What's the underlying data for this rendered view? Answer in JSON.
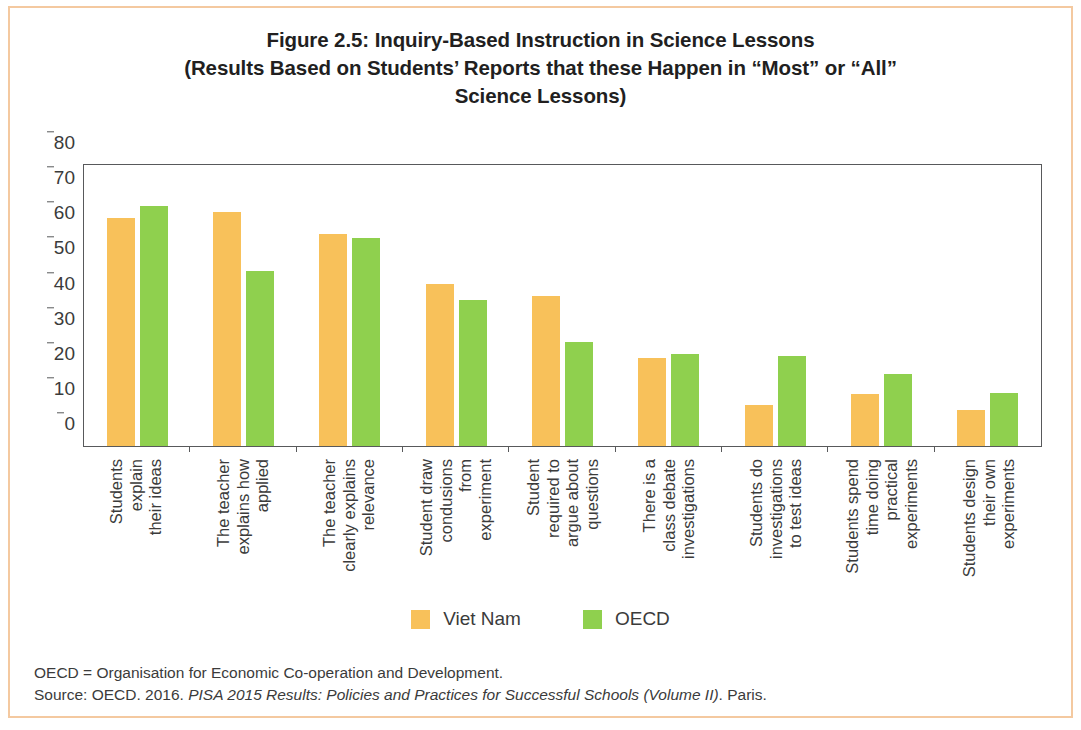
{
  "title": {
    "line1": "Figure 2.5: Inquiry-Based Instruction in Science Lessons",
    "line2": "(Results Based on Students’ Reports that these Happen in “Most” or “All”",
    "line3": "Science Lessons)"
  },
  "legend": {
    "vietnam_label": "Viet Nam",
    "oecd_label": "OECD"
  },
  "notes": {
    "abbreviation": "OECD = Organisation for Economic Co-operation and Development.",
    "source_prefix": "Source: OECD. 2016. ",
    "source_italic": "PISA 2015 Results: Policies and Practices for Successful Schools (Volume II)",
    "source_suffix": ". Paris."
  },
  "chart_data": {
    "type": "bar",
    "title": "Figure 2.5: Inquiry-Based Instruction in Science Lessons (Results Based on Students’ Reports that these Happen in “Most” or “All” Science Lessons)",
    "xlabel": "",
    "ylabel": "",
    "ylim": [
      0,
      80
    ],
    "yticks": [
      0,
      10,
      20,
      30,
      40,
      50,
      60,
      70,
      80
    ],
    "ytick_labels": [
      "0",
      "10",
      "20",
      "30",
      "40",
      "50",
      "60",
      "70",
      "80"
    ],
    "grid": false,
    "legend_position": "bottom-center",
    "colors": {
      "vietnam": "#f8c15a",
      "oecd": "#8fd04e",
      "axis": "#58595b",
      "text": "#3b3b3b",
      "frame": "#f4c9a0"
    },
    "categories": [
      "Students explain their ideas",
      "The teacher explains how applied",
      "The teacher clearly explains relevance",
      "Student draw condusions from experiment",
      "Student required to argue about questions",
      "There is a class debate investigations",
      "Students do investigations to test ideas",
      "Students spend time doing practical experiments",
      "Students design their own experiments"
    ],
    "category_lines": [
      [
        "Students",
        "explain",
        "their ideas"
      ],
      [
        "The teacher",
        "explains how",
        "applied"
      ],
      [
        "The teacher",
        "clearly explains",
        "relevance"
      ],
      [
        "Student draw",
        "condusions",
        "from",
        "experiment"
      ],
      [
        "Student",
        "required to",
        "argue about",
        "questions"
      ],
      [
        "There is a",
        "class debate",
        "investigations"
      ],
      [
        "Students do",
        "investigations",
        "to test ideas"
      ],
      [
        "Students spend",
        "time doing",
        "practical",
        "experiments"
      ],
      [
        "Students design",
        "their own",
        "experiments"
      ]
    ],
    "series": [
      {
        "name": "Viet Nam",
        "color": "#f8c15a",
        "values": [
          65.0,
          66.7,
          60.5,
          46.0,
          42.7,
          25.1,
          11.7,
          14.9,
          10.2
        ]
      },
      {
        "name": "OECD",
        "color": "#8fd04e",
        "values": [
          68.3,
          49.9,
          59.1,
          41.5,
          29.7,
          26.2,
          25.5,
          20.6,
          15.2
        ]
      }
    ]
  }
}
